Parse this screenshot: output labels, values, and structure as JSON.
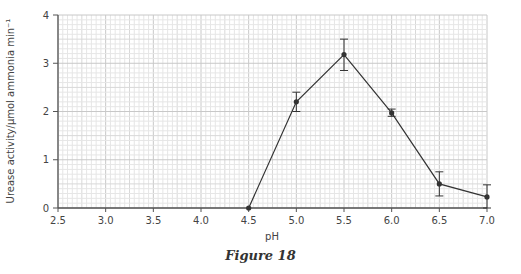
{
  "caption": "Figure 18",
  "chart_data": {
    "type": "line",
    "title": "",
    "xlabel": "pH",
    "ylabel": "Urease activity/μmol ammonia min⁻¹",
    "xlim": [
      2.5,
      7.0
    ],
    "ylim": [
      0,
      4
    ],
    "x_ticks": [
      "2.5",
      "3.0",
      "3.5",
      "4.0",
      "4.5",
      "5.0",
      "5.5",
      "6.0",
      "6.5",
      "7.0"
    ],
    "y_ticks": [
      "0",
      "1",
      "2",
      "3",
      "4"
    ],
    "grid": true,
    "legend": null,
    "series": [
      {
        "name": "Urease activity",
        "x": [
          4.5,
          5.0,
          5.5,
          6.0,
          6.5,
          7.0
        ],
        "values": [
          0.0,
          2.2,
          3.18,
          1.97,
          0.5,
          0.23
        ],
        "error_low": [
          null,
          2.0,
          2.85,
          1.9,
          0.25,
          0.0
        ],
        "error_high": [
          null,
          2.4,
          3.5,
          2.05,
          0.75,
          0.48
        ]
      }
    ],
    "colors": {
      "line": "#333333",
      "grid_minor": "#e6e6e6",
      "grid_major": "#c8c8c8",
      "axis": "#555555"
    }
  }
}
